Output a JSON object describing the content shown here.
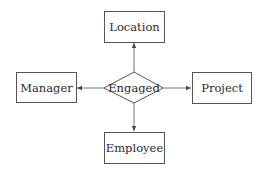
{
  "diagram": {
    "type": "entity-relationship",
    "relationship": {
      "label": "Engaged",
      "shape": "diamond"
    },
    "entities": [
      {
        "id": "location",
        "label": "Location",
        "position": "top"
      },
      {
        "id": "manager",
        "label": "Manager",
        "position": "left"
      },
      {
        "id": "project",
        "label": "Project",
        "position": "right"
      },
      {
        "id": "employee",
        "label": "Employee",
        "position": "bottom"
      }
    ],
    "edges": [
      {
        "from": "Engaged",
        "to": "Location",
        "arrow": "to"
      },
      {
        "from": "Engaged",
        "to": "Manager",
        "arrow": "to"
      },
      {
        "from": "Engaged",
        "to": "Project",
        "arrow": "to"
      },
      {
        "from": "Engaged",
        "to": "Employee",
        "arrow": "to"
      }
    ],
    "colors": {
      "stroke": "#555555",
      "text": "#2a2a2a",
      "background": "#ffffff"
    }
  }
}
